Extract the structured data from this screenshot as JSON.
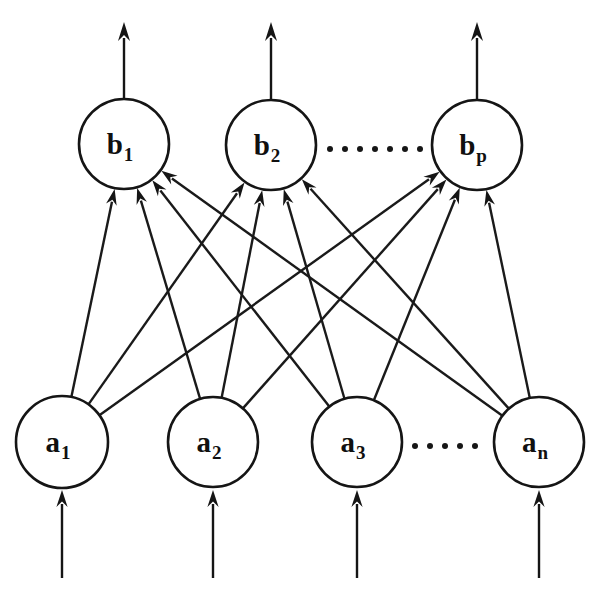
{
  "figure": {
    "background_color": "#ffffff",
    "stroke_color": "#151515",
    "label_color": "#101010",
    "width": 606,
    "height": 590
  },
  "layers": {
    "input_layer": {
      "name": "a-layer",
      "row_center_y": 442,
      "radius": 45,
      "nodes": [
        {
          "id": "a1",
          "base": "a",
          "subscript": "1",
          "label": "a₁",
          "cx": 62,
          "cy": 442,
          "r": 46
        },
        {
          "id": "a2",
          "base": "a",
          "subscript": "2",
          "label": "a₂",
          "cx": 213,
          "cy": 442,
          "r": 45
        },
        {
          "id": "a3",
          "base": "a",
          "subscript": "3",
          "label": "a₃",
          "cx": 357,
          "cy": 442,
          "r": 45
        },
        {
          "id": "an",
          "base": "a",
          "subscript": "n",
          "label": "aₙ",
          "cx": 539,
          "cy": 442,
          "r": 45
        }
      ],
      "ellipsis": {
        "name": "input-ellipsis",
        "dot_count": 5,
        "y": 446,
        "x_start": 415,
        "x_spacing": 15,
        "dot_radius": 3
      }
    },
    "output_layer": {
      "name": "b-layer",
      "row_center_y": 144,
      "radius": 45,
      "nodes": [
        {
          "id": "b1",
          "base": "b",
          "subscript": "1",
          "label": "b₁",
          "cx": 124,
          "cy": 144,
          "r": 45
        },
        {
          "id": "b2",
          "base": "b",
          "subscript": "2",
          "label": "b₂",
          "cx": 271,
          "cy": 145,
          "r": 45
        },
        {
          "id": "bp",
          "base": "b",
          "subscript": "p",
          "label": "bₚ",
          "cx": 477,
          "cy": 145,
          "r": 45
        }
      ],
      "ellipsis": {
        "name": "output-ellipsis",
        "dot_count": 7,
        "y": 149,
        "x_start": 330,
        "x_spacing": 15,
        "dot_radius": 3
      }
    }
  },
  "connections": {
    "description": "fully connected from every a-node to every b-node",
    "pairs": [
      [
        "a1",
        "b1"
      ],
      [
        "a1",
        "b2"
      ],
      [
        "a1",
        "bp"
      ],
      [
        "a2",
        "b1"
      ],
      [
        "a2",
        "b2"
      ],
      [
        "a2",
        "bp"
      ],
      [
        "a3",
        "b1"
      ],
      [
        "a3",
        "b2"
      ],
      [
        "a3",
        "bp"
      ],
      [
        "an",
        "b1"
      ],
      [
        "an",
        "b2"
      ],
      [
        "an",
        "bp"
      ]
    ]
  },
  "input_arrows": [
    {
      "name": "input-arrow-a1",
      "x": 62,
      "y_tail": 578,
      "y_tip": 490
    },
    {
      "name": "input-arrow-a2",
      "x": 213,
      "y_tail": 578,
      "y_tip": 490
    },
    {
      "name": "input-arrow-a3",
      "x": 357,
      "y_tail": 578,
      "y_tip": 490
    },
    {
      "name": "input-arrow-an",
      "x": 539,
      "y_tail": 578,
      "y_tip": 490
    }
  ],
  "output_arrows": [
    {
      "name": "output-arrow-b1",
      "x": 124,
      "y_tail": 99,
      "y_tip": 22
    },
    {
      "name": "output-arrow-b2",
      "x": 271,
      "y_tail": 100,
      "y_tip": 22
    },
    {
      "name": "output-arrow-bp",
      "x": 477,
      "y_tail": 100,
      "y_tip": 22
    }
  ]
}
